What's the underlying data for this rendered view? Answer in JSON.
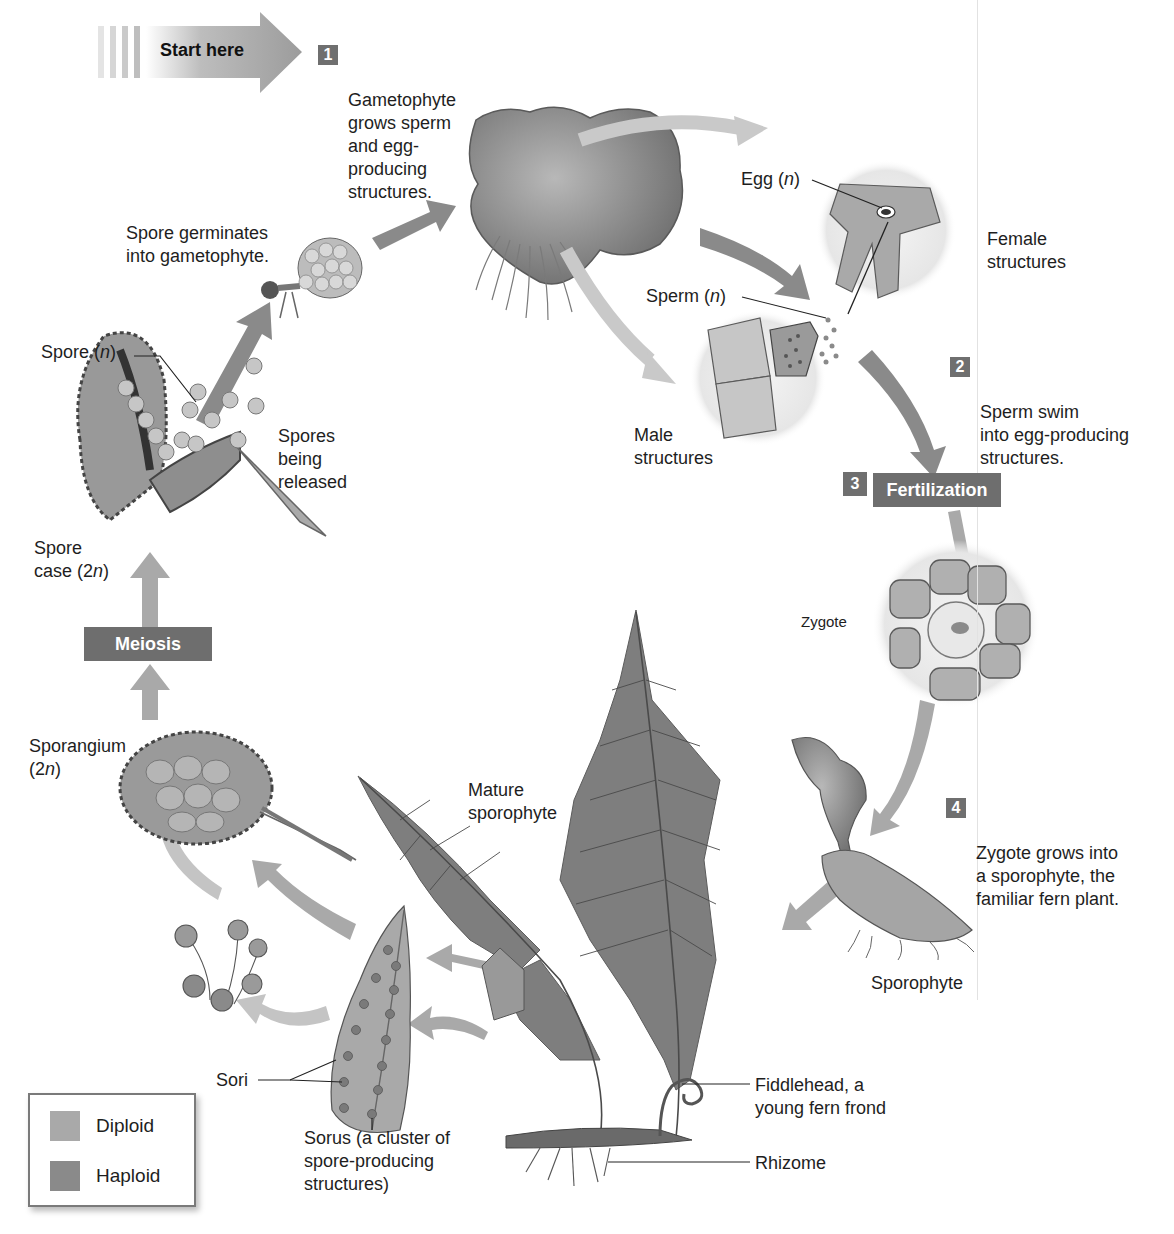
{
  "colors": {
    "diploid": "#a9a9a9",
    "haploid": "#8a8a8a",
    "step_box": "#6e6e6e",
    "text": "#1e1e1e"
  },
  "start_arrow": {
    "label": "Start here"
  },
  "steps": [
    {
      "number": "1",
      "text": "Gametophyte\ngrows sperm\nand egg-\nproducing\nstructures."
    },
    {
      "number": "2",
      "text": "Sperm swim\ninto egg-producing\nstructures."
    },
    {
      "number": "3",
      "text": "Fertilization"
    },
    {
      "number": "4",
      "text": "Zygote grows into\na sporophyte, the\nfamiliar fern plant."
    }
  ],
  "process_boxes": {
    "meiosis": "Meiosis"
  },
  "labels": {
    "egg": "Egg (n)",
    "female_structures": "Female\nstructures",
    "sperm": "Sperm (n)",
    "male_structures": "Male\nstructures",
    "zygote": "Zygote",
    "sporophyte": "Sporophyte",
    "mature_sporophyte": "Mature\nsporophyte",
    "fiddlehead": "Fiddlehead, a\nyoung fern frond",
    "rhizome": "Rhizome",
    "sorus": "Sorus (a cluster of\nspore-producing\nstructures)",
    "sori": "Sori",
    "sporangium": "Sporangium\n(2n)",
    "spore_case": "Spore\ncase (2n)",
    "spores_released": "Spores\nbeing\nreleased",
    "spore": "Spore (n)",
    "spore_germinates": "Spore germinates\ninto gametophyte."
  },
  "legend": [
    {
      "label": "Diploid",
      "color": "#a9a9a9"
    },
    {
      "label": "Haploid",
      "color": "#8a8a8a"
    }
  ]
}
